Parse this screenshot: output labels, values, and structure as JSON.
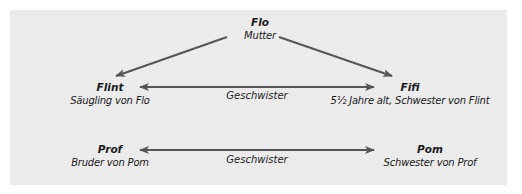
{
  "diagram": {
    "background": "#ebebeb",
    "arrow_color": "#555555",
    "nodes": {
      "flo": {
        "name": "Flo",
        "desc": "Mutter"
      },
      "flint": {
        "name": "Flint",
        "desc": "Säugling von Flo"
      },
      "fifi": {
        "name": "Fifi",
        "desc": "5½ Jahre alt, Schwester von Flint"
      },
      "prof": {
        "name": "Prof",
        "desc": "Bruder von Pom"
      },
      "pom": {
        "name": "Pom",
        "desc": "Schwester von Prof"
      }
    },
    "relations": {
      "flint_fifi": "Geschwister",
      "prof_pom": "Geschwister"
    }
  }
}
